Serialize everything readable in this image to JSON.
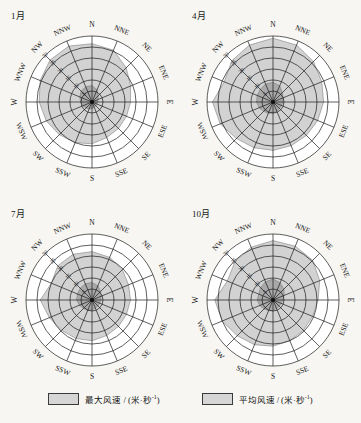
{
  "figure": {
    "background_color": "#f7f6f2",
    "width": 361,
    "height": 423
  },
  "legend": {
    "items": [
      {
        "name": "max-wind-speed",
        "label": "最大风速 / (米·秒",
        "exponent": "-1",
        "label_tail": ")",
        "swatch_fill": "#d6d6d6",
        "swatch_stroke": "#3a3a3a"
      },
      {
        "name": "mean-wind-speed",
        "label": "平均风速 / (米·秒",
        "exponent": "-1",
        "label_tail": ")",
        "swatch_fill": "#d6d6d6",
        "swatch_stroke": "#3a3a3a"
      }
    ]
  },
  "colors": {
    "max_fill": "#d2d2d2",
    "mean_fill": "#a9a9a9",
    "grid": "#1a1a1a",
    "text": "#151515"
  },
  "chart_data": {
    "type": "line",
    "chart_kind": "wind-rose-polar",
    "title": "",
    "directions": [
      "N",
      "NNE",
      "NE",
      "ENE",
      "E",
      "ESE",
      "SE",
      "SSE",
      "S",
      "SSW",
      "SW",
      "WSW",
      "W",
      "WNW",
      "NW",
      "NNW"
    ],
    "radial_ticks": [
      5,
      10,
      15,
      20,
      25,
      30
    ],
    "radial_tick_labels": [
      "5",
      "10",
      "15",
      "20",
      "25",
      "30"
    ],
    "radial_label_direction": "NW",
    "rlim": [
      0,
      30
    ],
    "rings": 6,
    "grid": true,
    "legend_position": "bottom",
    "xlabel": "",
    "ylabel": "风速 / (米·秒-1)",
    "units": "m/s",
    "panels": [
      {
        "title": "1月",
        "series": [
          {
            "name": "最大风速 / (米·秒-1)",
            "fill": "#d2d2d2",
            "values": [
              26.5,
              25.5,
              22.0,
              19.0,
              17.5,
              17.0,
              17.0,
              17.5,
              19.0,
              20.0,
              21.0,
              22.5,
              24.0,
              25.5,
              27.0,
              27.5
            ]
          },
          {
            "name": "平均风速 / (米·秒-1)",
            "fill": "#a9a9a9",
            "values": [
              7.5,
              6.0,
              4.0,
              3.0,
              2.6,
              2.4,
              2.4,
              2.6,
              3.0,
              3.4,
              3.8,
              4.4,
              5.2,
              6.0,
              7.0,
              7.5
            ]
          }
        ]
      },
      {
        "title": "4月",
        "series": [
          {
            "name": "最大风速 / (米·秒-1)",
            "fill": "#d2d2d2",
            "values": [
              29.0,
              28.0,
              26.0,
              24.0,
              23.0,
              22.0,
              21.5,
              21.5,
              22.0,
              22.5,
              23.5,
              26.0,
              27.5,
              24.0,
              26.5,
              28.0
            ]
          },
          {
            "name": "平均风速 / (米·秒-1)",
            "fill": "#a9a9a9",
            "values": [
              9.0,
              8.0,
              6.0,
              5.0,
              4.5,
              4.2,
              4.2,
              4.5,
              5.0,
              5.5,
              6.0,
              6.8,
              7.5,
              7.8,
              8.2,
              8.8
            ]
          }
        ]
      },
      {
        "title": "7月",
        "series": [
          {
            "name": "最大风速 / (米·秒-1)",
            "fill": "#d2d2d2",
            "values": [
              22.0,
              21.0,
              19.5,
              18.0,
              17.5,
              17.0,
              17.0,
              17.5,
              18.5,
              19.0,
              19.5,
              21.0,
              23.5,
              20.0,
              22.0,
              22.5
            ]
          },
          {
            "name": "平均风速 / (米·秒-1)",
            "fill": "#a9a9a9",
            "values": [
              8.0,
              7.0,
              5.5,
              4.5,
              4.0,
              3.8,
              3.8,
              4.0,
              4.5,
              5.0,
              5.5,
              6.2,
              7.0,
              7.2,
              7.6,
              8.0
            ]
          }
        ]
      },
      {
        "title": "10月",
        "series": [
          {
            "name": "最大风速 / (米·秒-1)",
            "fill": "#d2d2d2",
            "values": [
              27.0,
              26.5,
              25.5,
              23.0,
              20.5,
              19.5,
              19.5,
              20.0,
              21.0,
              22.0,
              23.0,
              25.0,
              26.5,
              22.5,
              24.5,
              26.0
            ]
          },
          {
            "name": "平均风速 / (米·秒-1)",
            "fill": "#a9a9a9",
            "values": [
              9.5,
              8.5,
              7.0,
              5.5,
              4.5,
              4.0,
              4.0,
              4.2,
              4.8,
              5.2,
              5.8,
              6.5,
              7.2,
              7.0,
              8.0,
              9.0
            ]
          }
        ]
      }
    ]
  }
}
